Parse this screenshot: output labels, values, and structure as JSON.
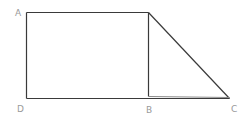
{
  "diagram": {
    "type": "geometry-figure",
    "points": {
      "A": {
        "label": "A"
      },
      "B": {
        "label": "B"
      },
      "C": {
        "label": "C"
      },
      "D": {
        "label": "D"
      }
    },
    "shapes": [
      "rectangle",
      "right-triangle"
    ],
    "stroke_color": "#3a3a3a",
    "label_color": "#9a9a9a"
  }
}
